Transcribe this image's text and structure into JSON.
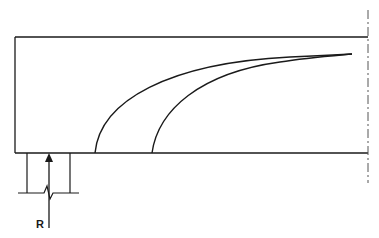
{
  "diagram": {
    "type": "beam-end-support-crack-pattern",
    "labels": {
      "reaction": "R"
    },
    "elements": {
      "beam": {
        "description": "beam elevation with end at left, centerline at right"
      },
      "centerline": {
        "style": "dash-dot"
      },
      "cracks": [
        {
          "id": "crack-1",
          "description": "inner curved crack from bottom near support to top right"
        },
        {
          "id": "crack-2",
          "description": "outer curved crack from bottom to top right"
        }
      ],
      "support": {
        "description": "column support below beam end, with break line"
      },
      "reaction_arrow": {
        "direction": "up"
      }
    },
    "colors": {
      "stroke": "#1a1a1a",
      "background": "#ffffff"
    }
  }
}
